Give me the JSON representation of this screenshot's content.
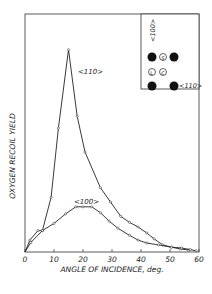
{
  "chart_data": {
    "type": "line",
    "title": "",
    "xlabel": "ANGLE OF INCIDENCE, deg.",
    "ylabel": "OXYGEN RECOIL YIELD",
    "xlim": [
      0,
      60
    ],
    "ylim": [
      0,
      100
    ],
    "x_ticks": [
      0,
      10,
      20,
      30,
      40,
      50,
      60
    ],
    "grid": false,
    "series": [
      {
        "name": "<110>",
        "points": [
          [
            0,
            0
          ],
          [
            1.7,
            5
          ],
          [
            4.5,
            9
          ],
          [
            6,
            9
          ],
          [
            9,
            23
          ],
          [
            11.5,
            52
          ],
          [
            15,
            85
          ],
          [
            18,
            57
          ],
          [
            20.7,
            42
          ],
          [
            26,
            27
          ],
          [
            29.5,
            21
          ],
          [
            33,
            15
          ],
          [
            36,
            12.5
          ],
          [
            39,
            10.5
          ],
          [
            42,
            8
          ],
          [
            44.5,
            5.5
          ],
          [
            47.5,
            3
          ],
          [
            50.5,
            2
          ],
          [
            53.5,
            1.3
          ],
          [
            56.5,
            0.8
          ]
        ]
      },
      {
        "name": "<100>",
        "points": [
          [
            0,
            0
          ],
          [
            2,
            4
          ],
          [
            6,
            9
          ],
          [
            10,
            12
          ],
          [
            14,
            16
          ],
          [
            17.5,
            19
          ],
          [
            20,
            19
          ],
          [
            23,
            19
          ],
          [
            26,
            16.5
          ],
          [
            29,
            13
          ],
          [
            32,
            10
          ],
          [
            36,
            7
          ],
          [
            39,
            5
          ],
          [
            42,
            3.8
          ],
          [
            46,
            3
          ],
          [
            50.5,
            2
          ],
          [
            54,
            1.7
          ],
          [
            57,
            1
          ],
          [
            59,
            0.5
          ]
        ]
      }
    ],
    "annotations": [
      {
        "text": "<110>",
        "x": 19,
        "y": 80
      },
      {
        "text": "<100>",
        "x": 17.5,
        "y": 23
      }
    ],
    "inset": {
      "label_top": "<100>",
      "label_right": "<110>",
      "atoms": [
        {
          "type": "filled",
          "label": ""
        },
        {
          "type": "open",
          "label": "S"
        },
        {
          "type": "filled",
          "label": ""
        },
        {
          "type": "open",
          "label": "L"
        },
        {
          "type": "open",
          "label": "C"
        },
        {
          "type": "filled",
          "label": ""
        },
        {
          "type": "filled",
          "label": ""
        }
      ]
    }
  },
  "labels": {
    "x_axis": "ANGLE OF INCIDENCE, deg.",
    "y_axis": "OXYGEN RECOIL YIELD",
    "curve_110": "<110>",
    "curve_100": "<100>",
    "inset_top": "<100>",
    "inset_right": "<110>",
    "atom_s": "S",
    "atom_l": "L",
    "atom_c": "C",
    "ticks": [
      "0",
      "10",
      "20",
      "30",
      "40",
      "50",
      "60"
    ]
  }
}
